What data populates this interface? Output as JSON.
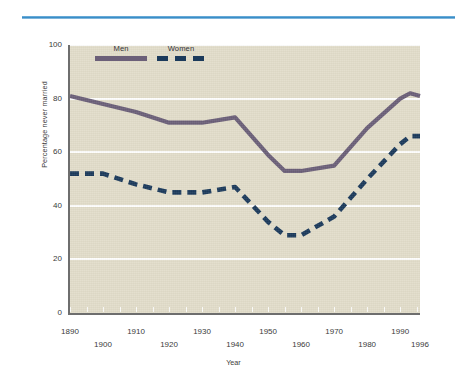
{
  "figure": {
    "divider": "horizontal-blue-rule"
  },
  "chart_data": {
    "type": "line",
    "title": "",
    "xlabel": "Year",
    "ylabel": "Percentage never married",
    "xlim": [
      1890,
      1996
    ],
    "ylim": [
      0,
      100
    ],
    "grid": true,
    "legend_position": "inside top-left",
    "ytick_labels": [
      "0",
      "20",
      "40",
      "60",
      "80",
      "100"
    ],
    "ytick_values": [
      0,
      20,
      40,
      60,
      80,
      100
    ],
    "xtick_labels": [
      "1890",
      "1900",
      "1910",
      "1920",
      "1930",
      "1940",
      "1950",
      "1960",
      "1970",
      "1980",
      "1990",
      "1996"
    ],
    "xtick_values": [
      1890,
      1900,
      1910,
      1920,
      1930,
      1940,
      1950,
      1960,
      1970,
      1980,
      1990,
      1996
    ],
    "x": [
      1890,
      1900,
      1910,
      1920,
      1930,
      1940,
      1950,
      1955,
      1960,
      1970,
      1975,
      1980,
      1990,
      1993,
      1996
    ],
    "series": [
      {
        "name": "Men",
        "style": "solid",
        "color": "#6b5f78",
        "values": [
          81,
          78,
          75,
          71,
          71,
          73,
          59,
          53,
          53,
          55,
          62,
          69,
          80,
          82,
          81
        ]
      },
      {
        "name": "Women",
        "style": "dashed",
        "color": "#1b3a5b",
        "values": [
          52,
          52,
          48,
          45,
          45,
          47,
          34,
          29,
          29,
          36,
          43,
          50,
          63,
          66,
          66
        ]
      }
    ]
  },
  "legend": {
    "entries": [
      {
        "label": "Men",
        "color": "#6b5f78",
        "style": "solid"
      },
      {
        "label": "Women",
        "color": "#1b3a5b",
        "style": "dashed"
      }
    ]
  },
  "colors": {
    "plot_background": "#e2ddca",
    "gridline": "#ffffff",
    "axis": "#6e6e6e",
    "rule": "#3f93cc",
    "men": "#6b5f78",
    "women": "#1b3a5b"
  }
}
